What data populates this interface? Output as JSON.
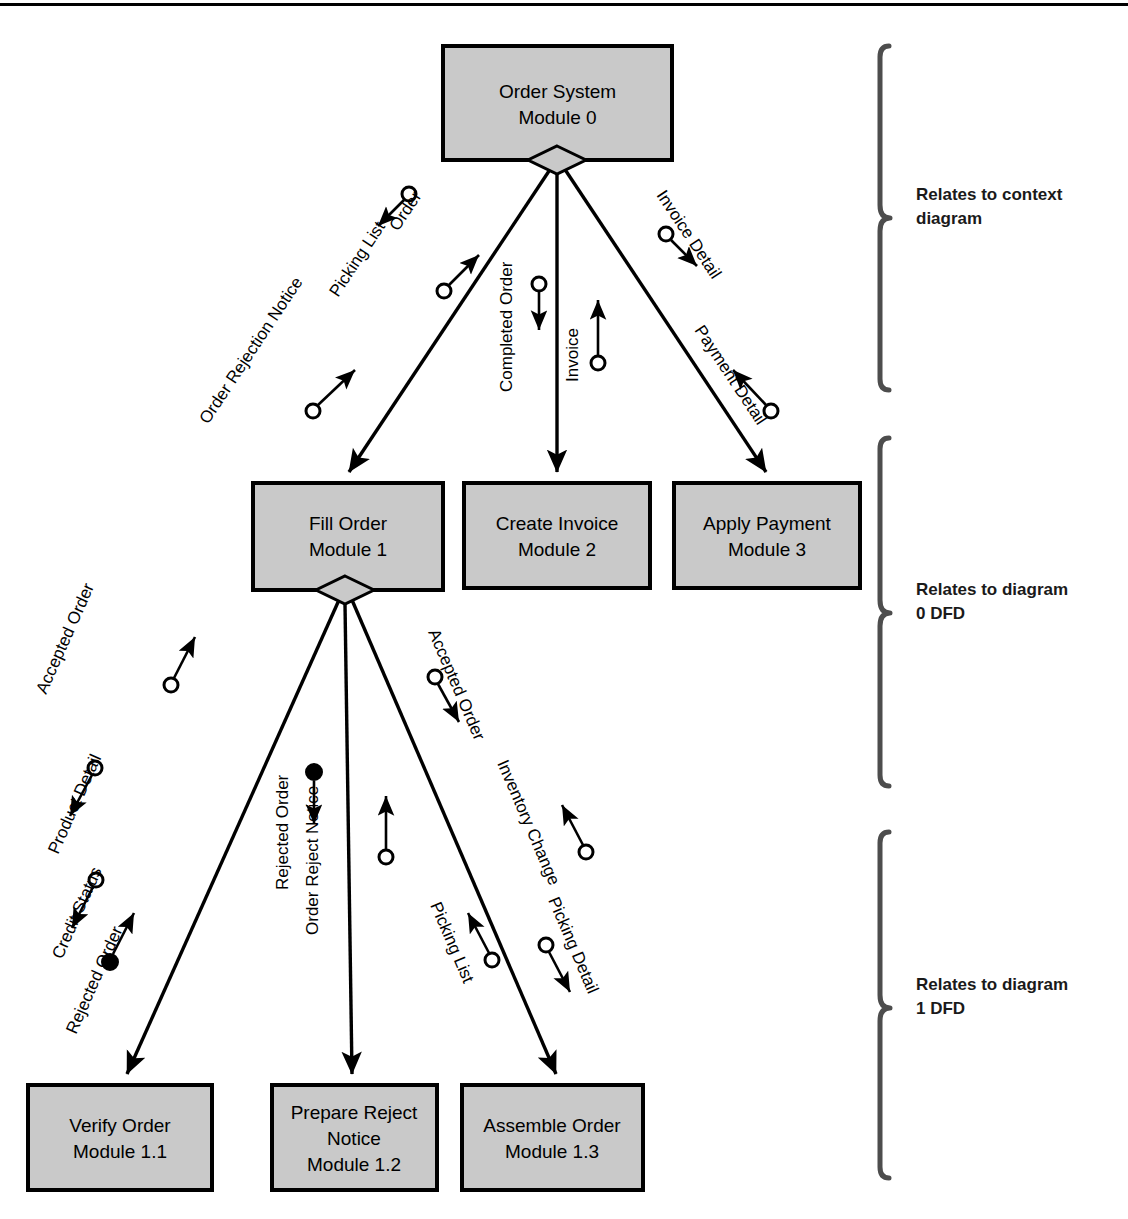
{
  "diagram": {
    "colors": {
      "module_fill": "#c9c9c9",
      "module_stroke": "#000000",
      "line": "#000000",
      "bracket": "#4d4d4d",
      "text": "#000000"
    }
  },
  "modules": [
    {
      "id": "m0",
      "name": "Order System",
      "number": "Module 0",
      "x": 443,
      "y": 46,
      "w": 229,
      "h": 114
    },
    {
      "id": "m1",
      "name": "Fill Order",
      "number": "Module 1",
      "x": 253,
      "y": 483,
      "w": 190,
      "h": 107
    },
    {
      "id": "m2",
      "name": "Create Invoice",
      "number": "Module 2",
      "x": 464,
      "y": 483,
      "w": 186,
      "h": 105
    },
    {
      "id": "m3",
      "name": "Apply Payment",
      "number": "Module 3",
      "x": 674,
      "y": 483,
      "w": 186,
      "h": 105
    },
    {
      "id": "m11",
      "name": "Verify Order",
      "number": "Module 1.1",
      "x": 28,
      "y": 1085,
      "w": 184,
      "h": 105
    },
    {
      "id": "m12",
      "name": "Prepare Reject",
      "name2": "Notice",
      "number": "Module 1.2",
      "x": 272,
      "y": 1085,
      "w": 165,
      "h": 105
    },
    {
      "id": "m13",
      "name": "Assemble Order",
      "number": "Module 1.3",
      "x": 462,
      "y": 1085,
      "w": 181,
      "h": 105
    }
  ],
  "connectors": [
    {
      "id": "c0-1",
      "from": "m0",
      "to": "m1"
    },
    {
      "id": "c0-2",
      "from": "m0",
      "to": "m2"
    },
    {
      "id": "c0-3",
      "from": "m0",
      "to": "m3"
    },
    {
      "id": "c1-11",
      "from": "m1",
      "to": "m11"
    },
    {
      "id": "c1-12",
      "from": "m1",
      "to": "m12"
    },
    {
      "id": "c1-13",
      "from": "m1",
      "to": "m13"
    }
  ],
  "data_flows": [
    {
      "id": "f1",
      "label": "Order",
      "couple": "data",
      "direction": "down",
      "connector": "c0-1"
    },
    {
      "id": "f2",
      "label": "Picking List",
      "couple": "data",
      "direction": "up",
      "connector": "c0-1"
    },
    {
      "id": "f3",
      "label": "Order Rejection Notice",
      "couple": "data",
      "direction": "up",
      "connector": "c0-1"
    },
    {
      "id": "f4",
      "label": "Completed Order",
      "couple": "data",
      "direction": "down",
      "connector": "c0-2"
    },
    {
      "id": "f5",
      "label": "Invoice",
      "couple": "data",
      "direction": "up",
      "connector": "c0-2"
    },
    {
      "id": "f6",
      "label": "Invoice Detail",
      "couple": "data",
      "direction": "down",
      "connector": "c0-3"
    },
    {
      "id": "f7",
      "label": "Payment Detail",
      "couple": "data",
      "direction": "up",
      "connector": "c0-3"
    },
    {
      "id": "f8",
      "label": "Accepted Order",
      "couple": "data",
      "direction": "up",
      "connector": "c1-11"
    },
    {
      "id": "f9",
      "label": "Product Detail",
      "couple": "data",
      "direction": "down",
      "connector": "c1-11"
    },
    {
      "id": "f10",
      "label": "Credit Status",
      "couple": "data",
      "direction": "down",
      "connector": "c1-11"
    },
    {
      "id": "f11",
      "label": "Rejected Order",
      "couple": "control",
      "direction": "up",
      "connector": "c1-11"
    },
    {
      "id": "f12",
      "label": "Rejected Order",
      "couple": "control",
      "direction": "down",
      "connector": "c1-12"
    },
    {
      "id": "f13",
      "label": "Order Reject Notice",
      "couple": "data",
      "direction": "up",
      "connector": "c1-12"
    },
    {
      "id": "f14",
      "label": "Accepted Order",
      "couple": "data",
      "direction": "down",
      "connector": "c1-13"
    },
    {
      "id": "f15",
      "label": "Inventory Change",
      "couple": "data",
      "direction": "up",
      "connector": "c1-13"
    },
    {
      "id": "f16",
      "label": "Picking List",
      "couple": "data",
      "direction": "up",
      "connector": "c1-13"
    },
    {
      "id": "f17",
      "label": "Picking Detail",
      "couple": "data",
      "direction": "down",
      "connector": "c1-13"
    }
  ],
  "brackets": [
    {
      "id": "b1",
      "line1": "Relates to context",
      "line2": "diagram",
      "top": 46,
      "bottom": 390,
      "x": 880,
      "label_y": 205
    },
    {
      "id": "b2",
      "line1": "Relates to diagram",
      "line2": "0 DFD",
      "top": 438,
      "bottom": 786,
      "x": 880,
      "label_y": 600
    },
    {
      "id": "b3",
      "line1": "Relates to diagram",
      "line2": "1 DFD",
      "top": 832,
      "bottom": 1178,
      "x": 880,
      "label_y": 995
    }
  ]
}
